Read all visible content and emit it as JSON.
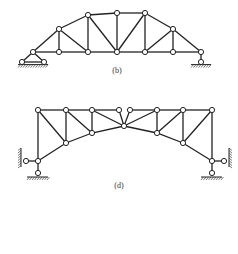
{
  "figures": [
    {
      "id": "b",
      "label": "(b)",
      "label_pos": [
        117,
        66
      ],
      "nodes": [
        [
          33,
          52
        ],
        [
          59,
          52
        ],
        [
          88,
          52
        ],
        [
          117,
          52
        ],
        [
          145,
          52
        ],
        [
          173,
          52
        ],
        [
          201,
          52
        ],
        [
          59,
          29
        ],
        [
          88,
          15
        ],
        [
          117,
          13
        ],
        [
          145,
          13
        ],
        [
          173,
          29
        ]
      ],
      "members": [
        [
          0,
          1
        ],
        [
          1,
          2
        ],
        [
          2,
          3
        ],
        [
          3,
          4
        ],
        [
          4,
          5
        ],
        [
          5,
          6
        ],
        [
          0,
          7
        ],
        [
          7,
          8
        ],
        [
          8,
          9
        ],
        [
          9,
          10
        ],
        [
          10,
          11
        ],
        [
          11,
          6
        ],
        [
          1,
          7
        ],
        [
          2,
          8
        ],
        [
          3,
          9
        ],
        [
          4,
          10
        ],
        [
          5,
          11
        ],
        [
          7,
          2
        ],
        [
          8,
          3
        ],
        [
          3,
          10
        ],
        [
          4,
          11
        ]
      ],
      "supports": [
        {
          "type": "pin",
          "at": [
            33,
            52
          ],
          "base": [
            [
              22,
              62
            ],
            [
              44,
              62
            ]
          ]
        },
        {
          "type": "roller",
          "at": [
            201,
            52
          ],
          "base": [
            [
              201,
              62
            ]
          ]
        }
      ]
    },
    {
      "id": "d",
      "label": "(d)",
      "label_pos": [
        119,
        181
      ],
      "nodes": [
        [
          38,
          110
        ],
        [
          66,
          110
        ],
        [
          92,
          110
        ],
        [
          119,
          110
        ],
        [
          130,
          110
        ],
        [
          157,
          110
        ],
        [
          183,
          110
        ],
        [
          212,
          110
        ],
        [
          38,
          161
        ],
        [
          66,
          143
        ],
        [
          92,
          133
        ],
        [
          124,
          126
        ],
        [
          157,
          133
        ],
        [
          183,
          143
        ],
        [
          212,
          161
        ]
      ],
      "members": [
        [
          0,
          1
        ],
        [
          1,
          2
        ],
        [
          2,
          3
        ],
        [
          4,
          5
        ],
        [
          5,
          6
        ],
        [
          6,
          7
        ],
        [
          8,
          9
        ],
        [
          9,
          10
        ],
        [
          10,
          11
        ],
        [
          11,
          12
        ],
        [
          12,
          13
        ],
        [
          13,
          14
        ],
        [
          0,
          8
        ],
        [
          7,
          14
        ],
        [
          1,
          9
        ],
        [
          2,
          10
        ],
        [
          5,
          12
        ],
        [
          6,
          13
        ],
        [
          0,
          9
        ],
        [
          1,
          10
        ],
        [
          2,
          11
        ],
        [
          3,
          11
        ],
        [
          4,
          11
        ],
        [
          5,
          11
        ],
        [
          12,
          6
        ],
        [
          13,
          7
        ]
      ],
      "supports": [
        {
          "type": "side-pin",
          "at": [
            38,
            161
          ],
          "side": "left",
          "node": [
            26,
            161
          ],
          "wall_x": 21
        },
        {
          "type": "bottom-pin",
          "at": [
            38,
            161
          ],
          "node": [
            38,
            173
          ],
          "ground_y": 177
        },
        {
          "type": "side-pin",
          "at": [
            212,
            161
          ],
          "side": "right",
          "node": [
            224,
            161
          ],
          "wall_x": 229
        },
        {
          "type": "bottom-pin",
          "at": [
            212,
            161
          ],
          "node": [
            212,
            173
          ],
          "ground_y": 177
        }
      ]
    }
  ],
  "style": {
    "stroke": "#222222",
    "node_fill": "#ffffff",
    "node_r": 2.6
  }
}
